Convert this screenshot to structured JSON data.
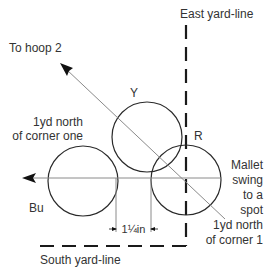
{
  "diagram": {
    "labels": {
      "east_yard_line": "East yard-line",
      "south_yard_line": "South yard-line",
      "to_hoop": "To hoop 2",
      "left_note_line1": "1yd north",
      "left_note_line2": "of corner one",
      "mallet_line1": "Mallet",
      "mallet_line2": "swing",
      "mallet_line3": "to a",
      "mallet_line4": "spot",
      "mallet_line5": "1yd north",
      "mallet_line6": "of corner 1",
      "measurement": "1¼in"
    },
    "balls": [
      {
        "id": "yellow",
        "label": "Y"
      },
      {
        "id": "blue",
        "label": "Bu"
      },
      {
        "id": "red",
        "label": "R"
      }
    ],
    "colors": {
      "stroke": "#2a2a2a",
      "guide_line": "#8a8a8a",
      "background": "#ffffff"
    }
  }
}
